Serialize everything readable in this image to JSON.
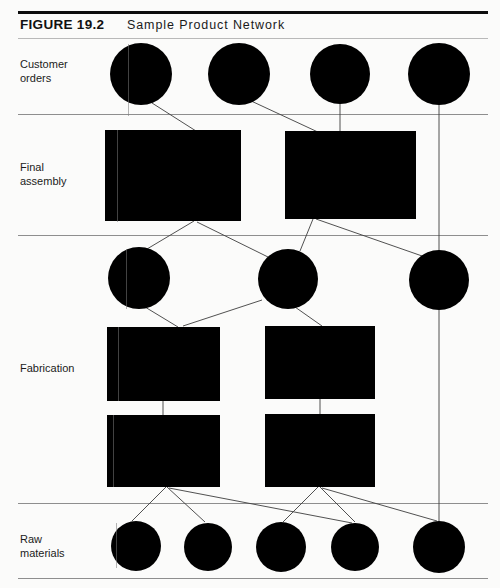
{
  "figure": {
    "label": "FIGURE 19.2",
    "title": "Sample  Product  Network"
  },
  "rows": [
    {
      "id": "customer-orders",
      "label": "Customer\norders"
    },
    {
      "id": "final-assembly",
      "label": "Final\nassembly"
    },
    {
      "id": "fabrication",
      "label": "Fabrication"
    },
    {
      "id": "raw-materials",
      "label": "Raw\nmaterials"
    }
  ],
  "colors": {
    "node_fill": "#000000",
    "link_stroke": "#3d3d3d",
    "rule_strong": "#0d0d0d",
    "rule_light": "#8e8e8e",
    "page_background": "#fbfbfa"
  },
  "chart_data": {
    "type": "diagram",
    "title": "Sample Product Network",
    "bands": [
      {
        "name": "Customer orders",
        "y_top": 38,
        "y_bottom": 114
      },
      {
        "name": "Final assembly",
        "y_top": 114,
        "y_bottom": 235
      },
      {
        "name": "Fabrication",
        "y_top": 235,
        "y_bottom": 503
      },
      {
        "name": "Raw materials",
        "y_top": 503,
        "y_bottom": 578
      }
    ],
    "band_rules_y": [
      114,
      235,
      503,
      578
    ],
    "nodes": [
      {
        "id": "co1",
        "tier": "customer-orders",
        "shape": "circle",
        "cx": 141,
        "cy": 74,
        "r": 31
      },
      {
        "id": "co2",
        "tier": "customer-orders",
        "shape": "circle",
        "cx": 239,
        "cy": 74,
        "r": 31
      },
      {
        "id": "co3",
        "tier": "customer-orders",
        "shape": "circle",
        "cx": 340,
        "cy": 74,
        "r": 30
      },
      {
        "id": "co4",
        "tier": "customer-orders",
        "shape": "circle",
        "cx": 439,
        "cy": 74,
        "r": 31
      },
      {
        "id": "fa1",
        "tier": "final-assembly",
        "shape": "rect",
        "x": 105,
        "y": 130,
        "w": 136,
        "h": 91
      },
      {
        "id": "fa2",
        "tier": "final-assembly",
        "shape": "rect",
        "x": 285,
        "y": 131,
        "w": 131,
        "h": 88
      },
      {
        "id": "it1",
        "tier": "fabrication",
        "shape": "circle",
        "cx": 139,
        "cy": 278,
        "r": 31
      },
      {
        "id": "it2",
        "tier": "fabrication",
        "shape": "circle",
        "cx": 288,
        "cy": 279,
        "r": 30
      },
      {
        "id": "it3",
        "tier": "fabrication",
        "shape": "circle",
        "cx": 439,
        "cy": 280,
        "r": 30
      },
      {
        "id": "fb1",
        "tier": "fabrication",
        "shape": "rect",
        "x": 107,
        "y": 327,
        "w": 113,
        "h": 74
      },
      {
        "id": "fb2",
        "tier": "fabrication",
        "shape": "rect",
        "x": 265,
        "y": 326,
        "w": 110,
        "h": 73
      },
      {
        "id": "fb3",
        "tier": "fabrication",
        "shape": "rect",
        "x": 107,
        "y": 415,
        "w": 113,
        "h": 72
      },
      {
        "id": "fb4",
        "tier": "fabrication",
        "shape": "rect",
        "x": 265,
        "y": 414,
        "w": 110,
        "h": 73
      },
      {
        "id": "rm1",
        "tier": "raw-materials",
        "shape": "circle",
        "cx": 136,
        "cy": 546,
        "r": 25
      },
      {
        "id": "rm2",
        "tier": "raw-materials",
        "shape": "circle",
        "cx": 208,
        "cy": 547,
        "r": 24
      },
      {
        "id": "rm3",
        "tier": "raw-materials",
        "shape": "circle",
        "cx": 281,
        "cy": 547,
        "r": 25
      },
      {
        "id": "rm4",
        "tier": "raw-materials",
        "shape": "circle",
        "cx": 355,
        "cy": 547,
        "r": 24
      },
      {
        "id": "rm5",
        "tier": "raw-materials",
        "shape": "circle",
        "cx": 439,
        "cy": 547,
        "r": 26
      }
    ],
    "links": [
      {
        "from": "co1",
        "to": "fa1",
        "x1": 152,
        "y1": 103,
        "x2": 196,
        "y2": 131
      },
      {
        "from": "co2",
        "to": "fa2",
        "x1": 249,
        "y1": 100,
        "x2": 320,
        "y2": 133
      },
      {
        "from": "co3",
        "to": "fa2",
        "x1": 340,
        "y1": 104,
        "x2": 340,
        "y2": 131
      },
      {
        "from": "co4",
        "to": "it3",
        "x1": 439,
        "y1": 104,
        "x2": 439,
        "y2": 252
      },
      {
        "from": "fa1",
        "to": "it1",
        "x1": 194,
        "y1": 221,
        "x2": 147,
        "y2": 249
      },
      {
        "from": "fa1",
        "to": "it2",
        "x1": 197,
        "y1": 222,
        "x2": 268,
        "y2": 257
      },
      {
        "from": "fa2",
        "to": "it2",
        "x1": 313,
        "y1": 219,
        "x2": 300,
        "y2": 251
      },
      {
        "from": "fa2",
        "to": "it3",
        "x1": 316,
        "y1": 219,
        "x2": 425,
        "y2": 257
      },
      {
        "from": "it1",
        "to": "fb1",
        "x1": 145,
        "y1": 307,
        "x2": 178,
        "y2": 327
      },
      {
        "from": "it2",
        "to": "fb2",
        "x1": 295,
        "y1": 307,
        "x2": 322,
        "y2": 326
      },
      {
        "from": "it2",
        "to": "fb1",
        "x1": 262,
        "y1": 300,
        "x2": 183,
        "y2": 326
      },
      {
        "from": "fb1",
        "to": "fb3",
        "x1": 163,
        "y1": 401,
        "x2": 163,
        "y2": 415
      },
      {
        "from": "fb2",
        "to": "fb4",
        "x1": 320,
        "y1": 399,
        "x2": 320,
        "y2": 414
      },
      {
        "from": "fb3",
        "to": "rm1",
        "x1": 166,
        "y1": 487,
        "x2": 132,
        "y2": 521
      },
      {
        "from": "fb3",
        "to": "rm2",
        "x1": 167,
        "y1": 487,
        "x2": 205,
        "y2": 522
      },
      {
        "from": "fb3",
        "to": "rm4",
        "x1": 169,
        "y1": 488,
        "x2": 352,
        "y2": 523
      },
      {
        "from": "fb4",
        "to": "rm3",
        "x1": 318,
        "y1": 487,
        "x2": 283,
        "y2": 522
      },
      {
        "from": "fb4",
        "to": "rm4",
        "x1": 320,
        "y1": 487,
        "x2": 355,
        "y2": 522
      },
      {
        "from": "fb4",
        "to": "rm5",
        "x1": 322,
        "y1": 488,
        "x2": 437,
        "y2": 521
      },
      {
        "from": "co4",
        "to": "rm5",
        "x1": 439,
        "y1": 310,
        "x2": 439,
        "y2": 521
      }
    ]
  }
}
